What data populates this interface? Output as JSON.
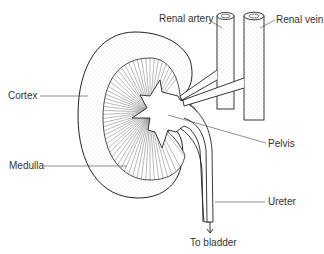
{
  "diagram": {
    "labels": {
      "renal_artery": "Renal artery",
      "renal_vein": "Renal vein",
      "cortex": "Cortex",
      "pelvis": "Pelvis",
      "medulla": "Medulla",
      "ureter": "Ureter",
      "to_bladder": "To bladder"
    },
    "colors": {
      "line": "#222222",
      "background": "#ffffff",
      "stipple": "#777777"
    }
  }
}
